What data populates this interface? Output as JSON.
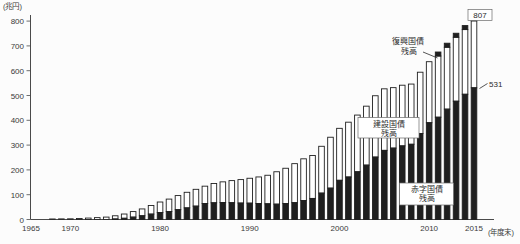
{
  "chart_data": {
    "type": "bar",
    "stacked": true,
    "title": "",
    "y_axis": {
      "unit_label": "(兆円)",
      "ticks": [
        0,
        100,
        200,
        300,
        400,
        500,
        600,
        700,
        800
      ],
      "ylim": [
        0,
        800
      ],
      "grid": false
    },
    "x_axis": {
      "unit_label": "(年度末)",
      "tick_years": [
        1965,
        1970,
        1980,
        1990,
        2000,
        2010,
        2015
      ]
    },
    "legend_position": "none",
    "colors": {
      "dark_fill": "#1f1f1f",
      "light_fill": "#ffffff",
      "bar_stroke": "#1f1f1f"
    },
    "x": [
      1965,
      1966,
      1967,
      1968,
      1969,
      1970,
      1971,
      1972,
      1973,
      1974,
      1975,
      1976,
      1977,
      1978,
      1979,
      1980,
      1981,
      1982,
      1983,
      1984,
      1985,
      1986,
      1987,
      1988,
      1989,
      1990,
      1991,
      1992,
      1993,
      1994,
      1995,
      1996,
      1997,
      1998,
      1999,
      2000,
      2001,
      2002,
      2003,
      2004,
      2005,
      2006,
      2007,
      2008,
      2009,
      2010,
      2011,
      2012,
      2013,
      2014,
      2015
    ],
    "series": [
      {
        "name": "赤字国債残高",
        "style": "dark",
        "values": [
          0.2,
          0,
          0,
          0,
          0,
          0,
          0,
          0,
          0,
          0,
          2.1,
          5.0,
          9.6,
          15.0,
          21.8,
          28.2,
          32.1,
          39.6,
          46.8,
          53.9,
          64.4,
          67.3,
          68.7,
          67.7,
          66.3,
          65.9,
          64.6,
          63.3,
          61.9,
          64.2,
          67.8,
          76.5,
          85.0,
          106.4,
          126.5,
          158.1,
          171.4,
          192.4,
          219.3,
          251.7,
          278.8,
          287.9,
          296.8,
          303.4,
          347.0,
          390.2,
          412.5,
          445.0,
          477.0,
          505.0,
          531.0
        ]
      },
      {
        "name": "建設国債残高",
        "style": "light",
        "values": [
          0,
          0.9,
          1.5,
          2.1,
          2.5,
          2.8,
          3.9,
          5.8,
          7.6,
          9.7,
          12.9,
          17.1,
          22.3,
          27.6,
          34.5,
          42.3,
          50.2,
          56.9,
          62.9,
          67.8,
          70.0,
          77.8,
          83.1,
          89.1,
          94.6,
          100.4,
          107.0,
          115.1,
          130.6,
          142.4,
          157.4,
          168.2,
          173.0,
          188.8,
          205.2,
          209.5,
          221.0,
          228.7,
          237.7,
          247.3,
          248.1,
          243.8,
          244.7,
          242.7,
          246.9,
          246.1,
          246.7,
          249.7,
          257.9,
          260.8,
          270.1
        ]
      },
      {
        "name": "復興国債残高",
        "style": "dark",
        "values": [
          0,
          0,
          0,
          0,
          0,
          0,
          0,
          0,
          0,
          0,
          0,
          0,
          0,
          0,
          0,
          0,
          0,
          0,
          0,
          0,
          0,
          0,
          0,
          0,
          0,
          0,
          0,
          0,
          0,
          0,
          0,
          0,
          0,
          0,
          0,
          0,
          0,
          0,
          0,
          0,
          0,
          0,
          0,
          0,
          0,
          0,
          10.7,
          10.3,
          9.0,
          8.3,
          5.9
        ]
      }
    ],
    "annotations": {
      "total_2015_label": "807",
      "deficit_2015_label": "531",
      "reconstruction_label_line1": "復興国債",
      "reconstruction_label_line2": "残高",
      "construction_label_line1": "建設国債",
      "construction_label_line2": "残高",
      "deficit_label_line1": "赤字国債",
      "deficit_label_line2": "残高"
    }
  }
}
